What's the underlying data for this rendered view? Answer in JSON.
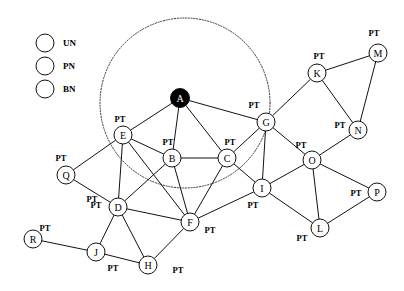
{
  "figure": {
    "title": "",
    "background_color": "#ffffff",
    "edge_color": "#111111",
    "node_stroke_color": "#111111"
  },
  "legend": {
    "name": "node-type-legend",
    "items": [
      {
        "key": "UN",
        "label": "UN",
        "fill": "#ffffff",
        "cx": 45,
        "cy": 43,
        "r": 9
      },
      {
        "key": "PN",
        "label": "PN",
        "fill": "#c9c9c9",
        "cx": 45,
        "cy": 66,
        "r": 9
      },
      {
        "key": "BN",
        "label": "BN",
        "fill": "#000000",
        "cx": 45,
        "cy": 89,
        "r": 9
      }
    ],
    "label_x": 63
  },
  "boundary_circle": {
    "name": "coverage-boundary",
    "cx": 185,
    "cy": 103,
    "r": 85,
    "style": "dotted",
    "color": "#333333"
  },
  "chart_data": {
    "type": "diagram",
    "graph_type": "node-link-network",
    "node_types": {
      "UN": "white",
      "PN": "gray",
      "BN": "black"
    },
    "edge_label_text": "PT",
    "nodes": [
      {
        "id": "A",
        "label": "A",
        "type": "BN",
        "x": 180,
        "y": 98,
        "r": 9.5
      },
      {
        "id": "B",
        "label": "B",
        "type": "UN",
        "x": 172,
        "y": 158,
        "r": 9
      },
      {
        "id": "C",
        "label": "C",
        "type": "UN",
        "x": 227,
        "y": 158,
        "r": 9
      },
      {
        "id": "D",
        "label": "D",
        "type": "UN",
        "x": 118,
        "y": 207,
        "r": 9
      },
      {
        "id": "E",
        "label": "E",
        "type": "UN",
        "x": 123,
        "y": 135,
        "r": 9
      },
      {
        "id": "F",
        "label": "F",
        "type": "UN",
        "x": 190,
        "y": 222,
        "r": 9
      },
      {
        "id": "G",
        "label": "G",
        "type": "UN",
        "x": 266,
        "y": 122,
        "r": 9
      },
      {
        "id": "H",
        "label": "H",
        "type": "UN",
        "x": 148,
        "y": 265,
        "r": 9
      },
      {
        "id": "I",
        "label": "I",
        "type": "UN",
        "x": 262,
        "y": 188,
        "r": 9
      },
      {
        "id": "J",
        "label": "J",
        "type": "UN",
        "x": 96,
        "y": 252,
        "r": 9
      },
      {
        "id": "K",
        "label": "K",
        "type": "UN",
        "x": 317,
        "y": 73,
        "r": 9
      },
      {
        "id": "L",
        "label": "L",
        "type": "UN",
        "x": 320,
        "y": 228,
        "r": 9
      },
      {
        "id": "M",
        "label": "M",
        "type": "UN",
        "x": 378,
        "y": 53,
        "r": 9
      },
      {
        "id": "N",
        "label": "N",
        "type": "UN",
        "x": 358,
        "y": 130,
        "r": 9
      },
      {
        "id": "O",
        "label": "O",
        "type": "UN",
        "x": 312,
        "y": 160,
        "r": 9
      },
      {
        "id": "P",
        "label": "P",
        "type": "UN",
        "x": 377,
        "y": 192,
        "r": 9
      },
      {
        "id": "Q",
        "label": "Q",
        "type": "UN",
        "x": 66,
        "y": 175,
        "r": 9
      },
      {
        "id": "R",
        "label": "R",
        "type": "UN",
        "x": 33,
        "y": 239,
        "r": 9
      }
    ],
    "edges": [
      {
        "source": "A",
        "target": "E"
      },
      {
        "source": "A",
        "target": "B"
      },
      {
        "source": "A",
        "target": "C"
      },
      {
        "source": "A",
        "target": "G"
      },
      {
        "source": "E",
        "target": "B"
      },
      {
        "source": "E",
        "target": "D"
      },
      {
        "source": "E",
        "target": "Q"
      },
      {
        "source": "E",
        "target": "F"
      },
      {
        "source": "B",
        "target": "C"
      },
      {
        "source": "B",
        "target": "D"
      },
      {
        "source": "B",
        "target": "F"
      },
      {
        "source": "C",
        "target": "F"
      },
      {
        "source": "C",
        "target": "I"
      },
      {
        "source": "C",
        "target": "G"
      },
      {
        "source": "G",
        "target": "I"
      },
      {
        "source": "G",
        "target": "K"
      },
      {
        "source": "G",
        "target": "O"
      },
      {
        "source": "K",
        "target": "M"
      },
      {
        "source": "K",
        "target": "N"
      },
      {
        "source": "M",
        "target": "N"
      },
      {
        "source": "N",
        "target": "O"
      },
      {
        "source": "O",
        "target": "I"
      },
      {
        "source": "O",
        "target": "L"
      },
      {
        "source": "O",
        "target": "P"
      },
      {
        "source": "I",
        "target": "F"
      },
      {
        "source": "I",
        "target": "L"
      },
      {
        "source": "L",
        "target": "P"
      },
      {
        "source": "D",
        "target": "Q"
      },
      {
        "source": "D",
        "target": "F"
      },
      {
        "source": "D",
        "target": "H"
      },
      {
        "source": "D",
        "target": "J"
      },
      {
        "source": "F",
        "target": "H"
      },
      {
        "source": "J",
        "target": "H"
      },
      {
        "source": "J",
        "target": "R"
      }
    ],
    "pt_labels": [
      {
        "text": "PT",
        "x": 120,
        "y": 119
      },
      {
        "text": "PT",
        "x": 168,
        "y": 142
      },
      {
        "text": "PT",
        "x": 230,
        "y": 142
      },
      {
        "text": "PT",
        "x": 254,
        "y": 105
      },
      {
        "text": "PT",
        "x": 319,
        "y": 56
      },
      {
        "text": "PT",
        "x": 374,
        "y": 33
      },
      {
        "text": "PT",
        "x": 340,
        "y": 125
      },
      {
        "text": "PT",
        "x": 301,
        "y": 145
      },
      {
        "text": "PT",
        "x": 356,
        "y": 193
      },
      {
        "text": "PT",
        "x": 302,
        "y": 238
      },
      {
        "text": "PT",
        "x": 253,
        "y": 205
      },
      {
        "text": "PT",
        "x": 210,
        "y": 230
      },
      {
        "text": "PT",
        "x": 178,
        "y": 270
      },
      {
        "text": "PT",
        "x": 113,
        "y": 268
      },
      {
        "text": "PT",
        "x": 96,
        "y": 205
      },
      {
        "text": "PT",
        "x": 61,
        "y": 158
      },
      {
        "text": "PT",
        "x": 45,
        "y": 228
      },
      {
        "text": "PT",
        "x": 92,
        "y": 199
      }
    ]
  }
}
